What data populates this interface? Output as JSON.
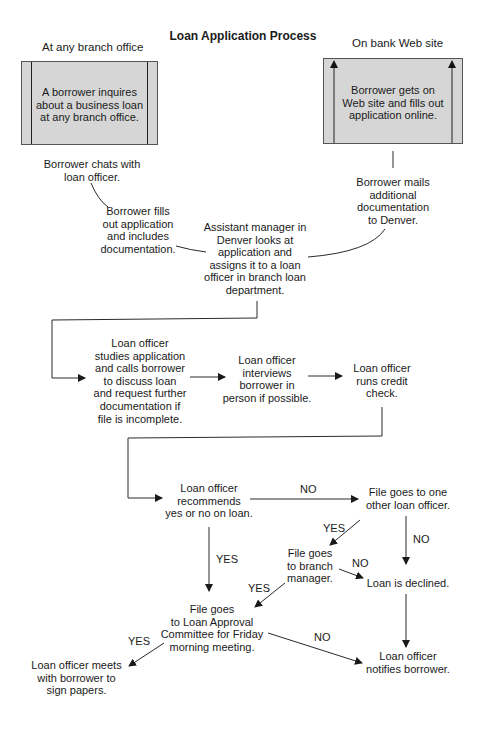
{
  "title": "Loan Application Process",
  "lanes": {
    "left": "At any branch office",
    "right": "On bank Web site"
  },
  "nodes": {
    "inquire": "A borrower inquires\nabout a business loan\nat any branch office.",
    "online": "Borrower gets on\nWeb site and fills out\napplication online.",
    "chat": "Borrower chats with\nloan officer.",
    "fill": "Borrower fills\nout application\nand includes\ndocumentation.",
    "mail": "Borrower mails\nadditional\ndocumentation\nto Denver.",
    "assistant": "Assistant manager in\nDenver looks at\napplication and\nassigns it to a loan\nofficer in branch loan\ndepartment.",
    "study": "Loan officer\nstudies application\nand calls borrower\nto discuss loan\nand request further\ndocumentation if\nfile is incomplete.",
    "interview": "Loan officer\ninterviews\nborrower in\nperson if possible.",
    "credit": "Loan officer\nruns credit\ncheck.",
    "recommend": "Loan officer\nrecommends\nyes or no on loan.",
    "other_officer": "File goes to one\nother loan officer.",
    "branch_manager": "File goes\nto branch\nmanager.",
    "declined": "Loan is declined.",
    "committee": "File goes\nto Loan Approval\nCommittee for Friday\nmorning meeting.",
    "sign": "Loan officer meets\nwith borrower to\nsign papers.",
    "notify": "Loan officer\nnotifies borrower."
  },
  "edge_labels": {
    "recommend_no": "NO",
    "recommend_yes": "YES",
    "other_yes": "YES",
    "other_no": "NO",
    "branch_no": "NO",
    "branch_yes": "YES",
    "committee_yes": "YES",
    "committee_no": "NO"
  },
  "colors": {
    "box_fill": "#d6d6d6",
    "line": "#222222"
  }
}
